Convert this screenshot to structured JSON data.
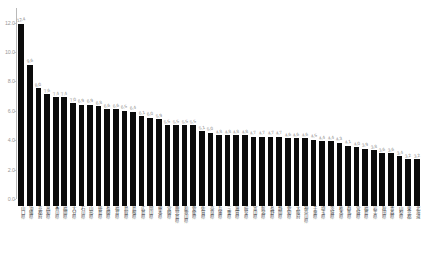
{
  "chart_data": {
    "type": "bar",
    "title": "",
    "subtitle": "",
    "xlabel": "",
    "ylabel": "",
    "ylim": [
      0.0,
      13.0
    ],
    "grid": false,
    "legend_position": "none",
    "bar_color": "#0b0b0b",
    "background_color": "#ffffff",
    "value_label_color": "#8a8a8a",
    "axis_label_color": "#9a9a9a",
    "ytick_labels": [
      "0.0",
      "2.0",
      "4.0",
      "6.0",
      "8.0",
      "10.0",
      "12.0"
    ],
    "ytick_values": [
      0.0,
      2.0,
      4.0,
      6.0,
      8.0,
      10.0,
      12.0
    ],
    "categories": [
      "山口県",
      "沖縄県",
      "京都府",
      "高知県",
      "香川県",
      "福岡県",
      "大分県",
      "石川県",
      "山形県",
      "徳島県",
      "長崎県",
      "福井県",
      "鳥取県",
      "島根県",
      "広島県",
      "岡山県",
      "熊本県",
      "宮崎県",
      "鹿児島県",
      "和歌山県",
      "愛媛県",
      "佐賀県",
      "奈良県",
      "兵庫県",
      "三重県",
      "滋賀県",
      "岐阜県",
      "富山県",
      "新潟県",
      "長野県",
      "静岡県",
      "愛知県",
      "大阪府",
      "神奈川県",
      "千葉県",
      "埼玉県",
      "茨城県",
      "栃木県",
      "群馬県",
      "宮城県",
      "福島県",
      "岩手県",
      "秋田県",
      "青森県",
      "山梨県",
      "東京都",
      "北海道"
    ],
    "values": [
      12.4,
      9.6,
      8.0,
      7.6,
      7.4,
      7.4,
      7.0,
      6.9,
      6.9,
      6.8,
      6.6,
      6.6,
      6.5,
      6.4,
      6.1,
      6.0,
      5.9,
      5.5,
      5.5,
      5.5,
      5.5,
      5.1,
      5.0,
      4.8,
      4.8,
      4.8,
      4.8,
      4.7,
      4.7,
      4.7,
      4.7,
      4.6,
      4.6,
      4.6,
      4.5,
      4.4,
      4.4,
      4.3,
      4.1,
      4.0,
      3.9,
      3.8,
      3.6,
      3.6,
      3.4,
      3.2,
      3.2
    ],
    "value_labels": [
      "12.4",
      "9.6",
      "8.0",
      "7.6",
      "7.4",
      "7.4",
      "7.0",
      "6.9",
      "6.9",
      "6.8",
      "6.6",
      "6.6",
      "6.5",
      "6.4",
      "6.1",
      "6.0",
      "5.9",
      "5.5",
      "5.5",
      "5.5",
      "5.5",
      "5.1",
      "5.0",
      "4.8",
      "4.8",
      "4.8",
      "4.8",
      "4.7",
      "4.7",
      "4.7",
      "4.7",
      "4.6",
      "4.6",
      "4.6",
      "4.5",
      "4.4",
      "4.4",
      "4.3",
      "4.1",
      "4.0",
      "3.9",
      "3.8",
      "3.6",
      "3.6",
      "3.4",
      "3.2",
      "3.2"
    ]
  }
}
